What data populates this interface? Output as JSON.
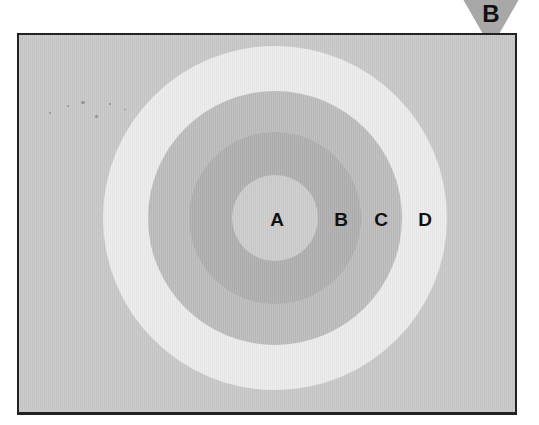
{
  "figure": {
    "badge": {
      "letter": "B",
      "shape": "downward-triangle",
      "color": "#a8a8a8"
    },
    "diagram": {
      "type": "concentric-circles",
      "center": [
        275,
        218
      ],
      "background_color": "#c9c9c9",
      "rings": [
        {
          "id": "D",
          "label": "D",
          "radius": 172,
          "color": "#ececec"
        },
        {
          "id": "C",
          "label": "C",
          "radius": 127,
          "color": "#bdbdbd"
        },
        {
          "id": "B",
          "label": "B",
          "radius": 86,
          "color": "#b0b0b0"
        },
        {
          "id": "A",
          "label": "A",
          "radius": 43,
          "color": "#cdcdcd"
        }
      ],
      "labels": {
        "a": "A",
        "b": "B",
        "c": "C",
        "d": "D"
      }
    }
  }
}
